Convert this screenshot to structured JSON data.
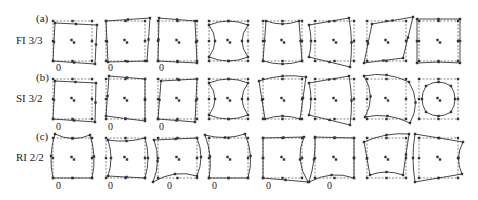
{
  "figure": {
    "rows": [
      {
        "panel": "(a)",
        "label": "FI 3/3",
        "zero_cols": [
          0,
          1,
          2
        ]
      },
      {
        "panel": "(b)",
        "label": "SI 3/2",
        "zero_cols": [
          0,
          1,
          2
        ]
      },
      {
        "panel": "(c)",
        "label": "RI 2/2",
        "zero_cols": [
          0,
          1,
          2,
          3,
          4,
          5
        ]
      }
    ],
    "zero_label": "0",
    "columns": 8,
    "line_color": "#333333",
    "dash_color": "#555555"
  }
}
